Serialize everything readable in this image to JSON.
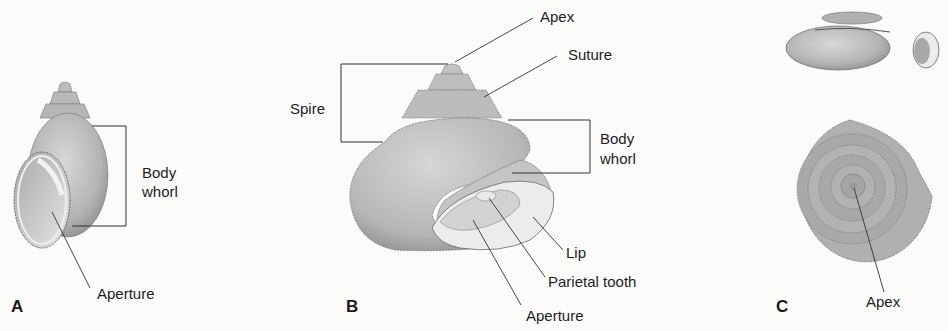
{
  "figure": {
    "panels": [
      {
        "letter": "A",
        "labels": {
          "body_whorl_1": "Body",
          "body_whorl_2": "whorl",
          "aperture": "Aperture"
        }
      },
      {
        "letter": "B",
        "labels": {
          "apex": "Apex",
          "suture": "Suture",
          "spire": "Spire",
          "body_whorl_1": "Body",
          "body_whorl_2": "whorl",
          "lip": "Lip",
          "parietal_tooth": "Parietal tooth",
          "aperture": "Aperture"
        }
      },
      {
        "letter": "C",
        "labels": {
          "apex": "Apex"
        }
      }
    ],
    "colors": {
      "shell_fill": "#bdbdbd",
      "shell_shadow": "#8f8f8f",
      "aperture_fill": "#e6e6e6",
      "line": "#2a2a2a",
      "background": "#fbfbf9"
    }
  }
}
